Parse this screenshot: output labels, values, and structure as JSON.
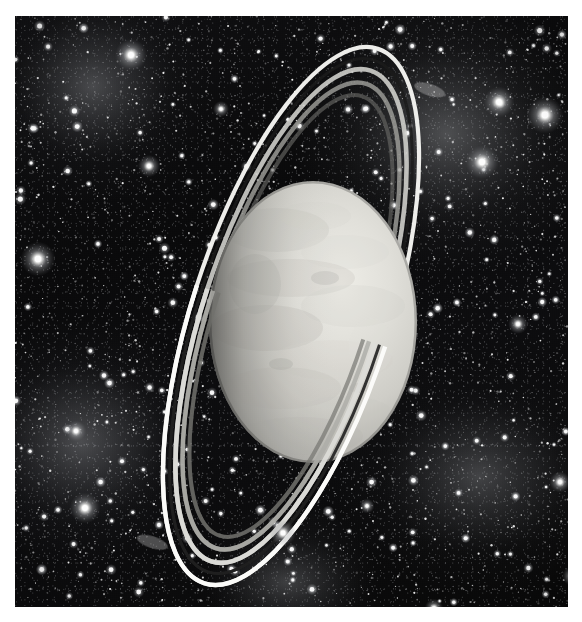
{
  "page": {
    "background_color": "#ffffff",
    "width": 582,
    "height": 622
  },
  "caption": {
    "text": "",
    "color": "#fbfbfb"
  },
  "plate": {
    "label": "ringed-planet-photograph",
    "x": 15,
    "y": 16,
    "width": 553,
    "height": 591,
    "background_color": "#0b0b0c",
    "medium": "black-and-white astronomical plate"
  },
  "scene": {
    "subject": "ringed planet with narrow bright ring system seen nearly edge-on-tilted",
    "palette": {
      "space_black": "#0a0a0b",
      "nebula_gray": "#5a5c60",
      "star_white": "#ffffff",
      "planet_light": "#e8e8e4",
      "planet_mid": "#c9c9c3",
      "planet_shadow": "#6e6e6a",
      "ring_bright": "#fdfdfb",
      "ring_mid": "#b9b9b4",
      "ring_dark": "#4a4a47"
    }
  },
  "planet": {
    "name": "planet-disc",
    "center_x": 298,
    "center_y": 306,
    "radius_x": 104,
    "radius_y": 141,
    "lit_side": "right",
    "terminator_side": "left",
    "surface": "mottled banded cloud texture, smooth featureless limb"
  },
  "rings": {
    "name": "ring-system",
    "tilt_degrees": 18,
    "ellipse_major_axis": 560,
    "ellipse_minor_axis": 198,
    "band_count": 5,
    "bands": [
      {
        "name": "outer-bright-ring",
        "brightness": "highest",
        "width_px": 4,
        "color": "#fdfdfb"
      },
      {
        "name": "gap-1",
        "brightness": "dark",
        "width_px": 3,
        "color": "#1a1a1a"
      },
      {
        "name": "mid-ring-a",
        "brightness": "high",
        "width_px": 5,
        "color": "#d8d8d3"
      },
      {
        "name": "mid-ring-b",
        "brightness": "medium",
        "width_px": 5,
        "color": "#a9a9a4"
      },
      {
        "name": "inner-faint-ring",
        "brightness": "low",
        "width_px": 4,
        "color": "#6d6d69"
      }
    ],
    "occlusion": "ring passes in front of planet at lower-left, behind planet at upper-right"
  },
  "starfield": {
    "name": "background-stars",
    "density": "very dense",
    "bright_stars": [
      {
        "x": 116,
        "y": 39,
        "r": 5.2
      },
      {
        "x": 530,
        "y": 99,
        "r": 6.0
      },
      {
        "x": 484,
        "y": 86,
        "r": 5.0
      },
      {
        "x": 467,
        "y": 146,
        "r": 5.4
      },
      {
        "x": 23,
        "y": 243,
        "r": 5.6
      },
      {
        "x": 70,
        "y": 492,
        "r": 5.0
      },
      {
        "x": 134,
        "y": 150,
        "r": 3.6
      },
      {
        "x": 61,
        "y": 415,
        "r": 3.4
      },
      {
        "x": 268,
        "y": 517,
        "r": 4.2
      },
      {
        "x": 503,
        "y": 308,
        "r": 3.2
      },
      {
        "x": 545,
        "y": 466,
        "r": 3.4
      },
      {
        "x": 419,
        "y": 592,
        "r": 3.0
      },
      {
        "x": 557,
        "y": 560,
        "r": 3.2
      },
      {
        "x": 206,
        "y": 93,
        "r": 2.6
      },
      {
        "x": 352,
        "y": 490,
        "r": 2.4
      }
    ],
    "nebulae": [
      {
        "name": "nebula-upper-right",
        "cx": 0.78,
        "cy": 0.2
      },
      {
        "name": "nebula-upper-left",
        "cx": 0.14,
        "cy": 0.12
      },
      {
        "name": "nebula-lower-left",
        "cx": 0.12,
        "cy": 0.72
      },
      {
        "name": "nebula-lower-right",
        "cx": 0.84,
        "cy": 0.78
      }
    ]
  }
}
